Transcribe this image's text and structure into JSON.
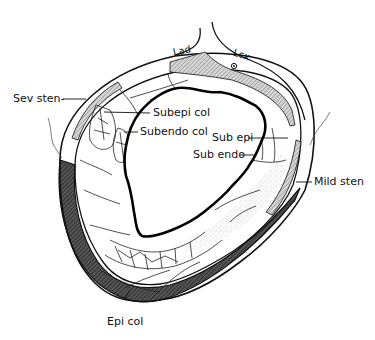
{
  "diagram": {
    "labels": {
      "lad": "Lad",
      "lcx": "Lcx",
      "sev_sten": "Sev sten-",
      "subepi_col": "Subepi col",
      "subendo_col": "Subendo col",
      "sub_epi": "Sub epi",
      "sub_endo": "Sub endo",
      "mild_sten": "Mild sten",
      "epi_col": "Epi col"
    },
    "colors": {
      "ink": "#111111",
      "hatch": "#8a8a8a",
      "dark_hatch": "#3a3a3a",
      "background": "#ffffff"
    }
  }
}
